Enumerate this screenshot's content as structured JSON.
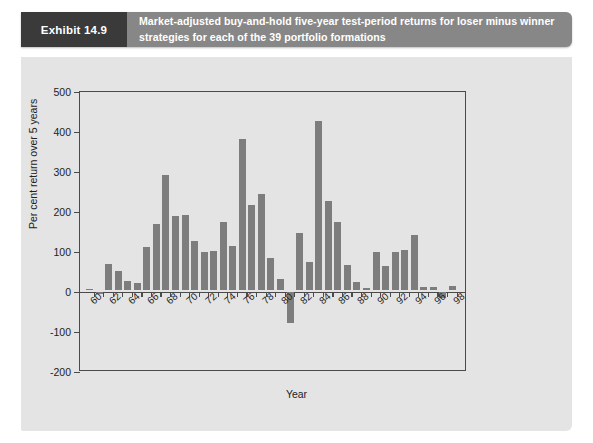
{
  "header": {
    "exhibit_tag": "Exhibit 14.9",
    "title": "Market-adjusted buy-and-hold five-year test-period returns for loser minus winner strategies for each of the 39 portfolio formations"
  },
  "colors": {
    "header_bar": "#878787",
    "exhibit_tag_bg": "#3a3a3a",
    "figure_bg": "#e4e4e4",
    "bar": "#7d7d7d",
    "axis": "#4a4a4a",
    "text": "#222222"
  },
  "chart_data": {
    "type": "bar",
    "title": "",
    "xlabel": "Year",
    "ylabel": "Per cent return over 5 years",
    "ylim": [
      -200,
      500
    ],
    "yticks": [
      500,
      400,
      300,
      200,
      100,
      0,
      -100,
      -200
    ],
    "ytick_labels": [
      "500",
      "400",
      "300",
      "200",
      "100",
      "0",
      "-100",
      "-200"
    ],
    "xtick_years": [
      60,
      62,
      64,
      66,
      68,
      70,
      72,
      74,
      76,
      78,
      80,
      82,
      84,
      86,
      88,
      90,
      92,
      94,
      96,
      98
    ],
    "grid": false,
    "legend": null,
    "categories": [
      "60",
      "61",
      "62",
      "63",
      "64",
      "65",
      "66",
      "67",
      "68",
      "69",
      "70",
      "71",
      "72",
      "73",
      "74",
      "75",
      "76",
      "77",
      "78",
      "79",
      "80",
      "81",
      "82",
      "83",
      "84",
      "85",
      "86",
      "87",
      "88",
      "89",
      "90",
      "91",
      "92",
      "93",
      "94",
      "95",
      "96",
      "97",
      "98"
    ],
    "values": [
      2,
      -6,
      65,
      48,
      22,
      18,
      108,
      165,
      287,
      185,
      188,
      122,
      96,
      98,
      170,
      110,
      378,
      212,
      240,
      80,
      28,
      -78,
      142,
      70,
      422,
      222,
      170,
      62,
      20,
      6,
      94,
      60,
      96,
      100,
      138,
      8,
      7,
      -15,
      10
    ]
  }
}
